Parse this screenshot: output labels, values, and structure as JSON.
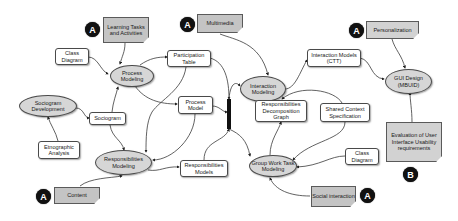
{
  "diagram": {
    "badges": {
      "a_label": "A",
      "b_label": "B"
    },
    "notes": {
      "learning_tasks": "Learning Tasks and Activities",
      "multimedia": "Multimedia",
      "personalization": "Personalization",
      "content": "Content",
      "social_interaction": "Social interaction",
      "evaluation": "Evaluation of User Interface Usability requirements"
    },
    "activities": {
      "process_modeling": "Process Modeling",
      "sociogram_development": "Sociogram Development",
      "responsibilities_modeling": "Responsibilities Modeling",
      "interaction_modeling": "Interaction Modeling",
      "group_work_task_modeling": "Group Work Task Modeling",
      "gui_design": "GUI Design (MBUID)"
    },
    "artifacts": {
      "class_diagram_left": "Class Diagram",
      "participation_table": "Participation Table",
      "sociogram": "Sociogram",
      "ethnographic_analysis": "Etnographic Analysis",
      "process_model": "Process Model",
      "responsibilities_models": "Responsibilities Models",
      "responsibilities_decomposition_graph": "Responsibilities Decomposition Graph",
      "interaction_models_ctt": "Interaction Models (CTT)",
      "shared_context_specification": "Shared Context Specification",
      "class_diagram_right": "Class Diagram"
    },
    "colors": {
      "note_fill": "#c4c4c4",
      "ellipse_fill": "#d6d6d6",
      "box_fill": "#ffffff",
      "badge_fill": "#111111",
      "line": "#3a3a3a"
    }
  }
}
